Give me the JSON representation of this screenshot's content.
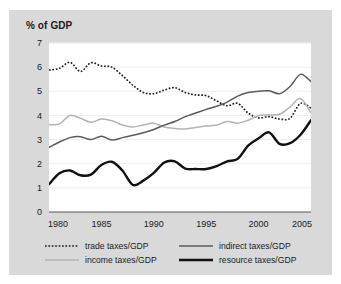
{
  "figure": {
    "background_color": "#d9d9d9",
    "plot_background_color": "#ffffff",
    "axis_title": "% of GDP"
  },
  "chart_data": {
    "type": "line",
    "title": "",
    "subtitle": "",
    "xlabel": "",
    "ylabel": "% of GDP",
    "xlim": [
      1980,
      2005
    ],
    "ylim": [
      0,
      7
    ],
    "grid": true,
    "legend_position": "bottom",
    "x_ticks": [
      "1980",
      "1985",
      "1990",
      "1995",
      "2000",
      "2005"
    ],
    "y_ticks": [
      "0",
      "1",
      "2",
      "3",
      "4",
      "5",
      "6",
      "7"
    ],
    "x": [
      1980,
      1981,
      1982,
      1983,
      1984,
      1985,
      1986,
      1987,
      1988,
      1989,
      1990,
      1991,
      1992,
      1993,
      1994,
      1995,
      1996,
      1997,
      1998,
      1999,
      2000,
      2001,
      2002,
      2003,
      2004,
      2005
    ],
    "series": [
      {
        "name": "trade taxes/GDP",
        "color": "#1a1a1a",
        "style": "dotted",
        "width": 1.6,
        "values": [
          5.88,
          5.95,
          6.2,
          5.82,
          6.18,
          6.05,
          6.0,
          5.65,
          5.25,
          4.95,
          4.9,
          5.05,
          5.15,
          4.95,
          4.85,
          4.82,
          4.6,
          4.4,
          4.5,
          4.1,
          3.9,
          3.95,
          3.85,
          3.88,
          4.5,
          4.3
        ]
      },
      {
        "name": "income taxes/GDP",
        "color": "#b3b3b3",
        "style": "solid",
        "width": 1.5,
        "values": [
          3.62,
          3.65,
          4.0,
          3.88,
          3.72,
          3.85,
          3.78,
          3.6,
          3.52,
          3.6,
          3.68,
          3.52,
          3.46,
          3.44,
          3.5,
          3.56,
          3.6,
          3.75,
          3.68,
          3.8,
          4.0,
          4.02,
          4.05,
          4.35,
          4.7,
          4.1
        ]
      },
      {
        "name": "indirect taxes/GDP",
        "color": "#5a5a5a",
        "style": "solid",
        "width": 1.5,
        "values": [
          2.68,
          2.9,
          3.08,
          3.12,
          3.0,
          3.14,
          2.98,
          3.08,
          3.18,
          3.28,
          3.42,
          3.6,
          3.75,
          3.95,
          4.1,
          4.25,
          4.38,
          4.55,
          4.8,
          4.95,
          5.0,
          5.02,
          4.9,
          5.2,
          5.7,
          5.4
        ]
      },
      {
        "name": "resource taxes/GDP",
        "color": "#111111",
        "style": "solid",
        "width": 2.4,
        "values": [
          1.15,
          1.6,
          1.72,
          1.52,
          1.55,
          1.95,
          2.08,
          1.72,
          1.12,
          1.3,
          1.62,
          2.05,
          2.1,
          1.8,
          1.78,
          1.78,
          1.9,
          2.1,
          2.2,
          2.75,
          3.05,
          3.3,
          2.82,
          2.85,
          3.2,
          3.8
        ]
      }
    ]
  },
  "legend": {
    "entries": [
      {
        "label": "trade taxes/GDP",
        "swatch": "dotted-black"
      },
      {
        "label": "indirect taxes/GDP",
        "swatch": "solid-gray"
      },
      {
        "label": "income taxes/GDP",
        "swatch": "solid-lightgray"
      },
      {
        "label": "resource taxes/GDP",
        "swatch": "solid-thick-black"
      }
    ]
  }
}
